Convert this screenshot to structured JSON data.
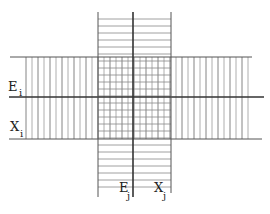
{
  "diagram": {
    "type": "crossed-bands",
    "labels": {
      "Ei": {
        "base": "E",
        "sub": "i"
      },
      "Xi": {
        "base": "X",
        "sub": "i"
      },
      "Ej": {
        "base": "E",
        "sub": "j"
      },
      "Xj": {
        "base": "X",
        "sub": "j"
      }
    },
    "colors": {
      "line": "#444444",
      "hatch": "#888888",
      "background": "#ffffff"
    }
  }
}
